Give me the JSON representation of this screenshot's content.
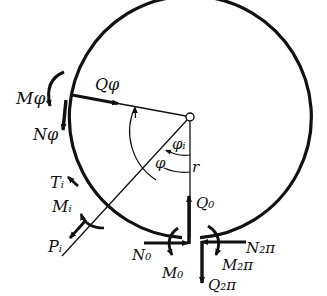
{
  "figure": {
    "colors": {
      "ink": "#111111",
      "background": "#ffffff"
    },
    "labels": {
      "M_phi": "Mφ",
      "Q_phi": "Qφ",
      "N_phi": "Nφ",
      "T_i": "Tᵢ",
      "M_i": "Mᵢ",
      "P_i": "Pᵢ",
      "phi_i": "φᵢ",
      "phi": "φ",
      "r": "r",
      "Q_0": "Q₀",
      "N_0": "N₀",
      "M_0": "M₀",
      "N_2pi": "N₂π",
      "M_2pi": "M₂π",
      "Q_2pi": "Q₂π"
    }
  }
}
